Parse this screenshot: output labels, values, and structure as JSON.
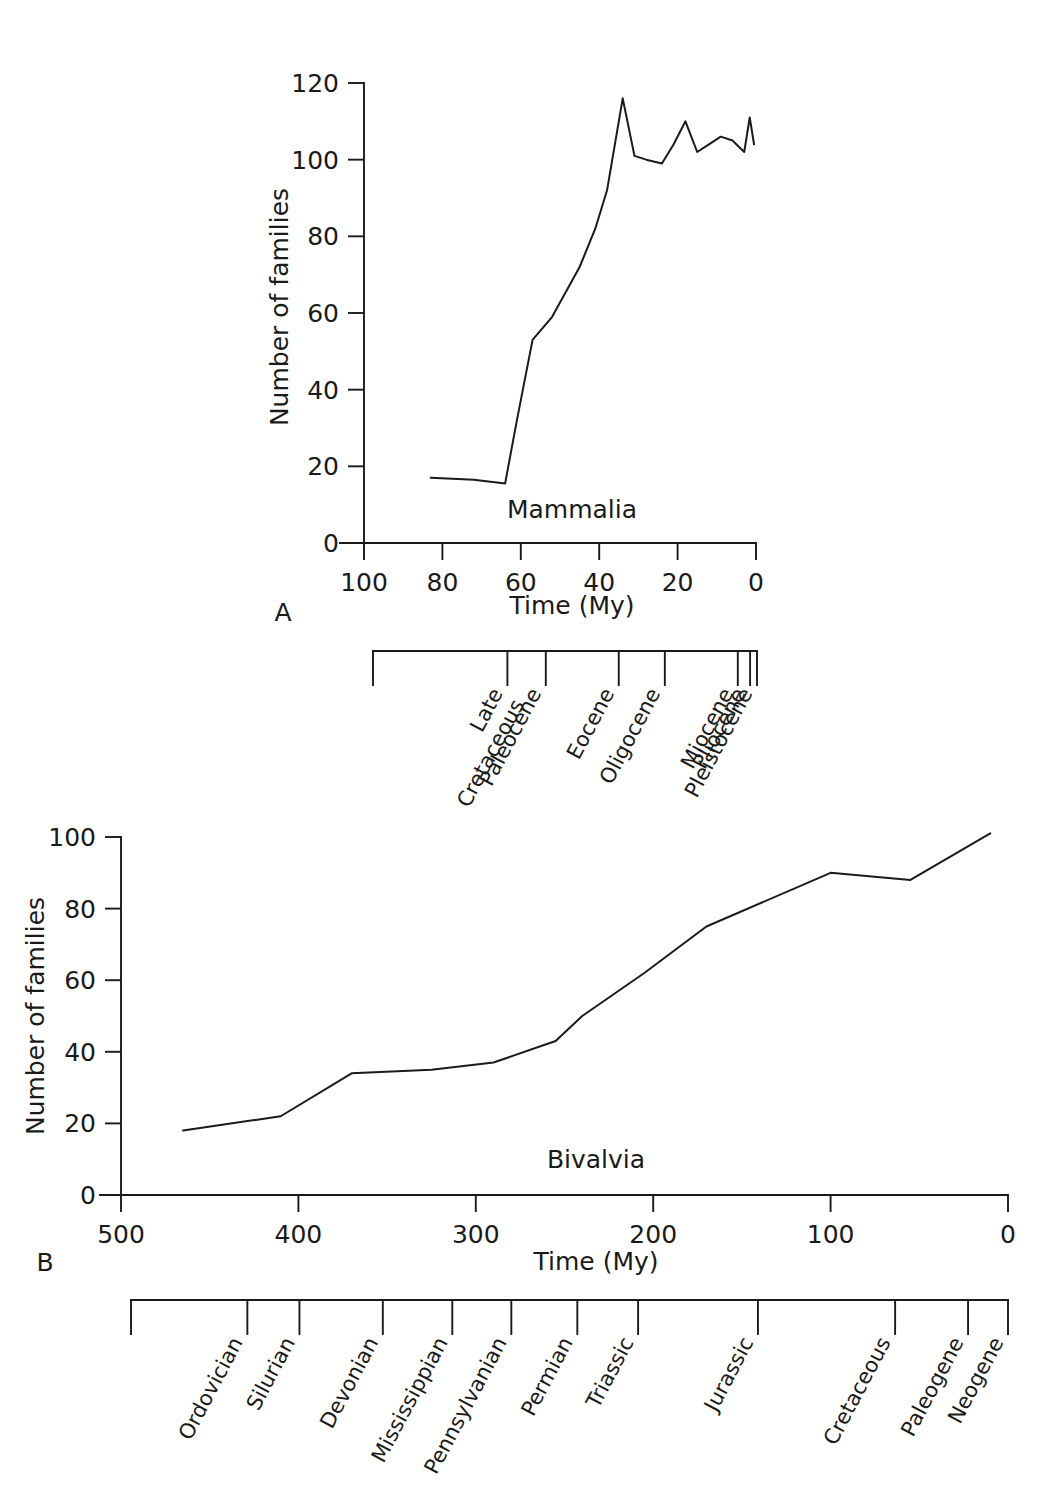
{
  "figure": {
    "background_color": "#ffffff",
    "line_color": "#1a1a1a"
  },
  "panels": [
    {
      "id": "A",
      "label": "A",
      "series_label": "Mammalia",
      "xlabel": "Time (My)",
      "ylabel": "Number of families",
      "xticks": [
        "100",
        "80",
        "60",
        "40",
        "20",
        "0"
      ],
      "yticks": [
        "0",
        "20",
        "40",
        "60",
        "80",
        "100",
        "120"
      ],
      "periods": [
        "Late\nCretaceous",
        "Paleocene",
        "Eocene",
        "Oligocene",
        "Miocene",
        "Pliocene",
        "Pleistocene"
      ]
    },
    {
      "id": "B",
      "label": "B",
      "series_label": "Bivalvia",
      "xlabel": "Time (My)",
      "ylabel": "Number of families",
      "xticks": [
        "500",
        "400",
        "300",
        "200",
        "100",
        "0"
      ],
      "yticks": [
        "0",
        "20",
        "40",
        "60",
        "80",
        "100"
      ],
      "periods": [
        "Ordovician",
        "Silurian",
        "Devonian",
        "Mississippian",
        "Pennsylvanian",
        "Permian",
        "Triassic",
        "Jurassic",
        "Cretaceous",
        "Paleogene",
        "Neogene"
      ]
    }
  ],
  "chart_data": [
    {
      "type": "line",
      "title": "Mammalia",
      "panel": "A",
      "xlabel": "Time (My)",
      "ylabel": "Number of families",
      "xlim": [
        100,
        0
      ],
      "ylim": [
        0,
        120
      ],
      "x_axis_inverted": true,
      "grid": false,
      "legend": "none",
      "xtick_values": [
        100,
        80,
        60,
        40,
        20,
        0
      ],
      "ytick_values": [
        0,
        20,
        40,
        60,
        80,
        100,
        120
      ],
      "series": [
        {
          "name": "Mammalia",
          "x": [
            83,
            72,
            64,
            61,
            57,
            52,
            45,
            41,
            38,
            34,
            31,
            28,
            24,
            21,
            18,
            15,
            12,
            9,
            6,
            3,
            1.6,
            0.5
          ],
          "y": [
            17,
            16.5,
            15.5,
            32,
            53,
            59,
            72,
            82,
            92,
            116,
            101,
            100,
            99,
            104,
            110,
            102,
            104,
            106,
            105,
            102,
            111,
            104
          ]
        }
      ],
      "timescale": {
        "label_axis": "geologic epochs",
        "boundaries_my": [
          100,
          65,
          55,
          36,
          24,
          5,
          1.8,
          0
        ],
        "units": [
          {
            "name": "Late Cretaceous",
            "start_my": 100,
            "end_my": 65
          },
          {
            "name": "Paleocene",
            "start_my": 65,
            "end_my": 55
          },
          {
            "name": "Eocene",
            "start_my": 55,
            "end_my": 36
          },
          {
            "name": "Oligocene",
            "start_my": 36,
            "end_my": 24
          },
          {
            "name": "Miocene",
            "start_my": 24,
            "end_my": 5
          },
          {
            "name": "Pliocene",
            "start_my": 5,
            "end_my": 1.8
          },
          {
            "name": "Pleistocene",
            "start_my": 1.8,
            "end_my": 0
          }
        ]
      }
    },
    {
      "type": "line",
      "title": "Bivalvia",
      "panel": "B",
      "xlabel": "Time (My)",
      "ylabel": "Number of families",
      "xlim": [
        500,
        0
      ],
      "ylim": [
        0,
        100
      ],
      "x_axis_inverted": true,
      "grid": false,
      "legend": "none",
      "xtick_values": [
        500,
        400,
        300,
        200,
        100,
        0
      ],
      "ytick_values": [
        0,
        20,
        40,
        60,
        80,
        100
      ],
      "series": [
        {
          "name": "Bivalvia",
          "x": [
            465,
            410,
            370,
            325,
            290,
            255,
            240,
            205,
            170,
            100,
            55,
            10
          ],
          "y": [
            18,
            22,
            34,
            35,
            37,
            43,
            50,
            62,
            75,
            90,
            88,
            101
          ]
        }
      ],
      "timescale": {
        "label_axis": "geologic periods",
        "boundaries_my": [
          505,
          438,
          408,
          360,
          320,
          286,
          248,
          213,
          144,
          65,
          23,
          0
        ],
        "units": [
          {
            "name": "Ordovician",
            "start_my": 505,
            "end_my": 438
          },
          {
            "name": "Silurian",
            "start_my": 438,
            "end_my": 408
          },
          {
            "name": "Devonian",
            "start_my": 408,
            "end_my": 360
          },
          {
            "name": "Mississippian",
            "start_my": 360,
            "end_my": 320
          },
          {
            "name": "Pennsylvanian",
            "start_my": 320,
            "end_my": 286
          },
          {
            "name": "Permian",
            "start_my": 286,
            "end_my": 248
          },
          {
            "name": "Triassic",
            "start_my": 248,
            "end_my": 213
          },
          {
            "name": "Jurassic",
            "start_my": 213,
            "end_my": 144
          },
          {
            "name": "Cretaceous",
            "start_my": 144,
            "end_my": 65
          },
          {
            "name": "Paleogene",
            "start_my": 65,
            "end_my": 23
          },
          {
            "name": "Neogene",
            "start_my": 23,
            "end_my": 0
          }
        ]
      }
    }
  ]
}
